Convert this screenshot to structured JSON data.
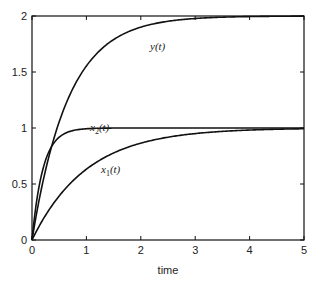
{
  "chart_data": {
    "type": "line",
    "title": "",
    "xlabel": "time",
    "ylabel": "",
    "xlim": [
      0,
      5
    ],
    "ylim": [
      0,
      2
    ],
    "x_ticks": [
      "0",
      "1",
      "2",
      "3",
      "4",
      "5"
    ],
    "y_ticks": [
      "0",
      "0.5",
      "1",
      "1.5",
      "2"
    ],
    "grid": false,
    "legend": "none (inline curve labels)",
    "series": [
      {
        "name": "y(t)",
        "label_main": "y",
        "label_sub": "",
        "formula": "2(1-e^{-1.5t})",
        "x": [
          0,
          0.25,
          0.5,
          1,
          1.5,
          2,
          3,
          4,
          5
        ],
        "values": [
          0,
          0.62,
          1.05,
          1.55,
          1.79,
          1.9,
          1.98,
          2.0,
          2.0
        ]
      },
      {
        "name": "x2(t)",
        "label_main": "x",
        "label_sub": "2",
        "formula": "1-e^{-5t}",
        "x": [
          0,
          0.1,
          0.25,
          0.5,
          1,
          2,
          3,
          4,
          5
        ],
        "values": [
          0,
          0.39,
          0.71,
          0.92,
          0.99,
          1.0,
          1.0,
          1.0,
          1.0
        ]
      },
      {
        "name": "x1(t)",
        "label_main": "x",
        "label_sub": "1",
        "formula": "1-e^{-t}",
        "x": [
          0,
          0.5,
          1,
          1.5,
          2,
          3,
          4,
          5
        ],
        "values": [
          0,
          0.39,
          0.63,
          0.78,
          0.86,
          0.95,
          0.98,
          0.99
        ]
      }
    ]
  }
}
